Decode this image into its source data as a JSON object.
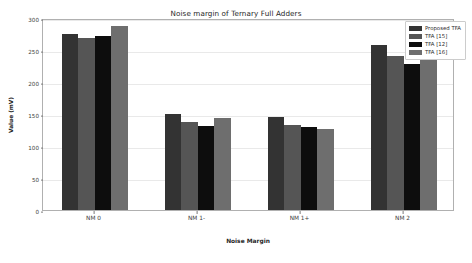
{
  "chart_data": {
    "type": "bar",
    "title": "Noise margin of Ternary Full Adders",
    "xlabel": "Noise Margin",
    "ylabel": "Value (mV)",
    "categories": [
      "NM 0",
      "NM 1-",
      "NM 1+",
      "NM 2"
    ],
    "ylim": [
      0,
      300
    ],
    "yticks": [
      0,
      50,
      100,
      150,
      200,
      250,
      300
    ],
    "grid": true,
    "legend_position": "upper right",
    "series": [
      {
        "name": "Proposed TFA",
        "color": "#333333",
        "values": [
          275,
          150,
          145,
          258
        ]
      },
      {
        "name": "TFA [15]",
        "color": "#555555",
        "values": [
          268,
          137,
          133,
          241
        ]
      },
      {
        "name": "TFA [12]",
        "color": "#0d0d0d",
        "values": [
          272,
          131,
          130,
          228
        ]
      },
      {
        "name": "TFA [16]",
        "color": "#6e6e6e",
        "values": [
          287,
          143,
          127,
          236
        ]
      }
    ]
  }
}
